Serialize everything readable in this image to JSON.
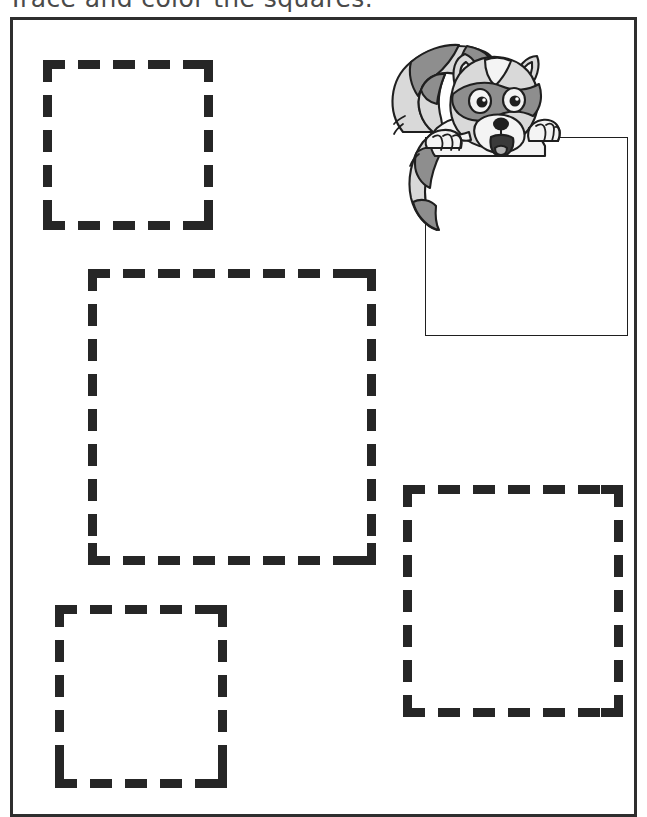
{
  "worksheet": {
    "title": "Trace and color the squares.",
    "background_color": "#ffffff",
    "frame_color": "#2e2e2e",
    "trace_stroke_color": "#262626"
  },
  "shapes": {
    "type": "square",
    "count": 4,
    "style": "dashed-outline-for-tracing",
    "items": [
      {
        "name": "square-top-left",
        "x": 40,
        "y": 57,
        "size": 170
      },
      {
        "name": "square-center-large",
        "x": 85,
        "y": 266,
        "size": 288
      },
      {
        "name": "square-bottom-right",
        "x": 400,
        "y": 482,
        "size": 220
      },
      {
        "name": "square-bottom-left",
        "x": 52,
        "y": 602,
        "size": 172
      }
    ]
  },
  "illustration": {
    "character": "raccoon",
    "description": "cartoon raccoon peeking over a blank sign",
    "sign": {
      "x": 425,
      "y": 137,
      "width": 203,
      "height": 199,
      "fill": "#ffffff"
    },
    "colors": {
      "fur_dark": "#8e8e8e",
      "fur_light": "#d9d9d9",
      "fur_white": "#f4f4f4",
      "outline": "#1f1f1f",
      "nose": "#1f1f1f",
      "tongue": "#b0b0b0"
    }
  }
}
